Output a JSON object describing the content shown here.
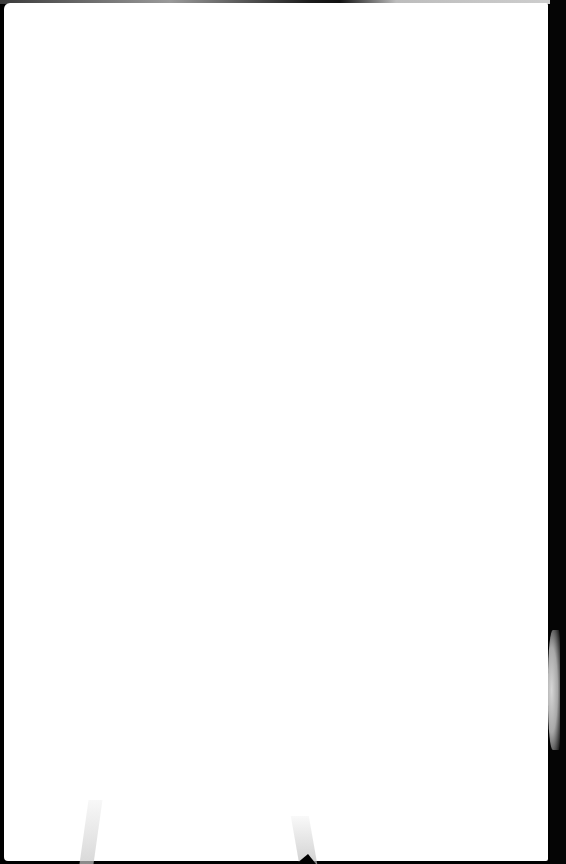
{
  "page": {
    "type": "blank scanned page",
    "content_text": "",
    "colors": {
      "paper": "#ffffff",
      "scan_border": "#000000"
    }
  }
}
